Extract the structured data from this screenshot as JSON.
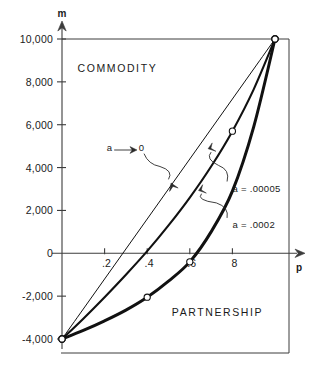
{
  "chart_data": {
    "type": "line",
    "title": "",
    "xlabel": "p",
    "ylabel": "m",
    "xlim": [
      0,
      1.0
    ],
    "ylim": [
      -4000,
      10000
    ],
    "grid": false,
    "legend_position": "inline-annotations",
    "xticks": [
      0.2,
      0.4,
      0.6,
      0.8
    ],
    "xticklabels": [
      ".2",
      ".4",
      ".6",
      "8"
    ],
    "yticks": [
      -4000,
      -2000,
      0,
      2000,
      4000,
      6000,
      8000,
      10000
    ],
    "yticklabels": [
      "-4,000",
      "-2,000",
      "0",
      "2,000",
      "4,000",
      "6,000",
      "8,000",
      "10,000"
    ],
    "series": [
      {
        "name": "a ⟶ 0",
        "label": "a",
        "arrow": "⟶",
        "limit": "0",
        "style": "thin-straight",
        "x": [
          0.0,
          0.1,
          0.2,
          0.3,
          0.4,
          0.5,
          0.6,
          0.7,
          0.8,
          0.9,
          1.0
        ],
        "y": [
          -4000,
          -2600,
          -1200,
          200,
          1600,
          3000,
          4400,
          5800,
          7200,
          8600,
          10000
        ],
        "markers": [
          {
            "x": 0.0,
            "y": -4000
          },
          {
            "x": 1.0,
            "y": 10000
          }
        ]
      },
      {
        "name": "a = .00005",
        "style": "medium-curve",
        "x": [
          0.0,
          0.1,
          0.2,
          0.3,
          0.4,
          0.5,
          0.6,
          0.7,
          0.8,
          0.9,
          1.0
        ],
        "y": [
          -4000,
          -3050,
          -2050,
          -1000,
          100,
          1300,
          2600,
          4050,
          5700,
          7650,
          10000
        ],
        "markers": [
          {
            "x": 0.0,
            "y": -4000
          },
          {
            "x": 0.8,
            "y": 5700
          },
          {
            "x": 1.0,
            "y": 10000
          }
        ]
      },
      {
        "name": "a = .0002",
        "style": "thick-curve",
        "x": [
          0.0,
          0.1,
          0.2,
          0.3,
          0.4,
          0.5,
          0.6,
          0.7,
          0.8,
          0.9,
          1.0
        ],
        "y": [
          -4000,
          -3600,
          -3150,
          -2650,
          -2050,
          -1300,
          -400,
          1000,
          2900,
          5900,
          10000
        ],
        "markers": [
          {
            "x": 0.0,
            "y": -4000
          },
          {
            "x": 0.4,
            "y": -2050
          },
          {
            "x": 0.6,
            "y": -400
          },
          {
            "x": 1.0,
            "y": 10000
          }
        ]
      }
    ],
    "annotations": [
      {
        "name": "region-commodity",
        "text": "COMMODITY",
        "x": 0.26,
        "y": 8650
      },
      {
        "name": "region-partnership",
        "text": "PARTNERSHIP",
        "x": 0.73,
        "y": -2750
      },
      {
        "name": "curve-label-alpha-to-zero",
        "text": "a",
        "x": 0.21,
        "y": 4950
      },
      {
        "name": "curve-label-alpha-to-zero-limit",
        "text": "0",
        "x": 0.36,
        "y": 4950
      },
      {
        "name": "curve-label-00005",
        "text": "a = .00005",
        "x": 0.8,
        "y": 3050
      },
      {
        "name": "curve-label-0002",
        "text": "a = .0002",
        "x": 0.8,
        "y": 1350
      }
    ]
  },
  "axes": {
    "y_axis_name": "m",
    "x_axis_name": "p"
  },
  "colors": {
    "ink": "#111111",
    "axis": "#3c3c3c",
    "background": "#ffffff",
    "marker_fill": "#ffffff"
  }
}
